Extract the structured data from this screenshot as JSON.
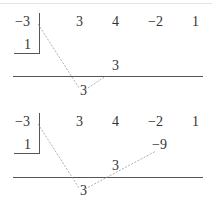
{
  "colors": {
    "text": "#333333",
    "rule": "#555555",
    "dashed_arrow": "#999999",
    "background": "#ffffff"
  },
  "steps": [
    {
      "label": "Step 1: bring down leading coefficient and multiply",
      "divisor": "−3",
      "divisor_below": "1",
      "coefficients": [
        "3",
        "4",
        "−2",
        "1"
      ],
      "products": [
        "",
        "3",
        "",
        ""
      ],
      "results": [
        "3",
        "",
        "",
        ""
      ],
      "arrows": [
        {
          "from": "divisor",
          "to": "result-0",
          "style": "dashed"
        },
        {
          "from": "result-0",
          "to": "product-1",
          "style": "dashed"
        }
      ]
    },
    {
      "label": "Step 2: multiply and write under next coefficient",
      "divisor": "−3",
      "divisor_below": "1",
      "coefficients": [
        "3",
        "4",
        "−2",
        "1"
      ],
      "products": [
        "",
        "3",
        "−9",
        ""
      ],
      "results": [
        "3",
        "",
        "",
        ""
      ],
      "arrows": [
        {
          "from": "divisor",
          "to": "result-0",
          "style": "dashed"
        },
        {
          "from": "result-0",
          "to": "product-2",
          "style": "dashed"
        }
      ]
    }
  ]
}
